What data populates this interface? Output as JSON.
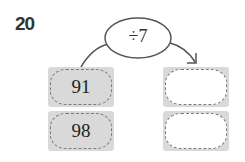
{
  "question": {
    "number": "20"
  },
  "operation": {
    "label": "÷7"
  },
  "inputs": [
    {
      "value": "91"
    },
    {
      "value": "98"
    }
  ],
  "outputs": [
    {
      "value": ""
    },
    {
      "value": ""
    }
  ]
}
